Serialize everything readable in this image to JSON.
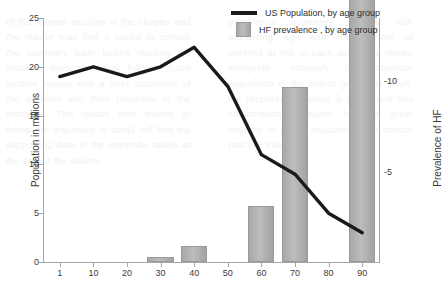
{
  "chart_data": {
    "type": "line",
    "title": "",
    "xlabel": "",
    "ylabel": "Population in millions",
    "y2label": "Prevalence of HF",
    "x": [
      1,
      10,
      20,
      30,
      40,
      50,
      60,
      70,
      80,
      90
    ],
    "categories": [
      "1",
      "10",
      "20",
      "30",
      "40",
      "50",
      "60",
      "70",
      "80",
      "90"
    ],
    "ylim": [
      0,
      25
    ],
    "yticks": [
      0,
      5,
      10,
      15,
      20,
      25
    ],
    "ytick_labels": [
      "0",
      "5",
      "10",
      "15",
      "20",
      "25"
    ],
    "y2lim": [
      0,
      13.5
    ],
    "y2ticks": [
      5,
      10
    ],
    "y2tick_labels": [
      "-5",
      "-10"
    ],
    "xtick_labels": [
      "1",
      "10",
      "20",
      "30",
      "40",
      "50",
      "60",
      "70",
      "80",
      "90"
    ],
    "grid": false,
    "legend_position": "top-right",
    "series": [
      {
        "name": "US Population, by age group",
        "type": "line",
        "axis": "left",
        "color": "#1a1a1a",
        "values": [
          19,
          20,
          19,
          20,
          22,
          18,
          11,
          9,
          5,
          3
        ]
      },
      {
        "name": "HF prevalence , by age group",
        "type": "bar",
        "axis": "right",
        "color": "#b0b0b0",
        "values": [
          0,
          0,
          0,
          0.3,
          0.9,
          0,
          3.1,
          9.7,
          0,
          17.8
        ]
      }
    ]
  },
  "legend": {
    "items": [
      {
        "label": "US Population, by age group",
        "marker": "line"
      },
      {
        "label": "HF prevalence , by age group",
        "marker": "square"
      }
    ]
  },
  "axes": {
    "left_title": "Population in millions",
    "right_title": "Prevalence of HF"
  },
  "colors": {
    "line": "#1a1a1a",
    "bar": "#b0b0b0",
    "axis": "#a6a6a6",
    "text": "#3b3b3b",
    "background": "#ffffff"
  },
  "ghost_text": {
    "left": "of the several sections of the chapter and the reader may find it useful to consult the summary table before reading the detailed discussion that follows. Each section begins with a brief statement of the problem and then proceeds to the evidence. The reader who wishes to follow the argument in detail will find the supporting data in the appendix tables at the end of the volume.",
    "right": "prevalence increases sharply with advancing age and the number of persons at risk in each decade is shown alongside. Although the absolute population in the oldest groups is small, the proportion affected is large, and this combination accounts for the great majority of cases encountered in clinical practice today."
  }
}
